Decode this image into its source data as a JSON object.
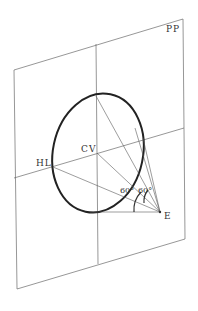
{
  "diagram": {
    "labels": {
      "picture_plane": "PP",
      "center_of_vision": "CV",
      "horizon_line": "HL",
      "eye": "E",
      "angle_left": "60°",
      "angle_right": "60°"
    },
    "colors": {
      "background": "#ffffff",
      "lines": "#6a6a6a",
      "cone_of_vision": "#222222"
    }
  }
}
